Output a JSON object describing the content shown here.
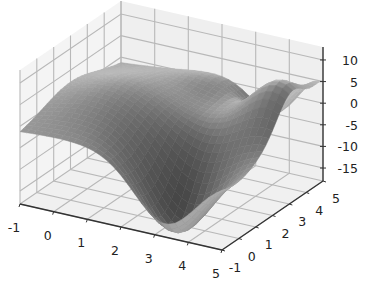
{
  "chart_data": {
    "type": "surface3d",
    "title": "",
    "xlabel": "",
    "ylabel": "",
    "zlabel": "",
    "x_ticks": [
      "-1",
      "0",
      "1",
      "2",
      "3",
      "4",
      "5"
    ],
    "y_ticks": [
      "-1",
      "0",
      "1",
      "2",
      "3",
      "4",
      "5"
    ],
    "z_ticks": [
      "10",
      "5",
      "0",
      "-5",
      "-10",
      "-15"
    ],
    "xlim": [
      -1,
      5
    ],
    "ylim": [
      -1,
      5
    ],
    "zlim": [
      -18,
      13
    ],
    "grid": true,
    "colormap": "grayscale",
    "surface_description": "Smooth wavy surface with deep minimum (~-18) near x=3.5, y=0; broad ridge along x≈0..1 (~+5); peak (~+10) near x=4, y=3; valleys and ripples at high y",
    "notable_points": [
      {
        "x": 3.5,
        "y": 0,
        "z": -18,
        "label": "global minimum"
      },
      {
        "x": 4.5,
        "y": 3,
        "z": 10,
        "label": "peak"
      },
      {
        "x": 0.5,
        "y": 2,
        "z": 5,
        "label": "ridge"
      },
      {
        "x": -1,
        "y": -1,
        "z": -3,
        "label": "front-left corner"
      }
    ]
  },
  "colors": {
    "pane": "#f2f2f2",
    "grid": "#b8b8b8",
    "axis_line": "#333333",
    "surface_dark": "#3a3a3a",
    "surface_light": "#c8c8c8"
  }
}
